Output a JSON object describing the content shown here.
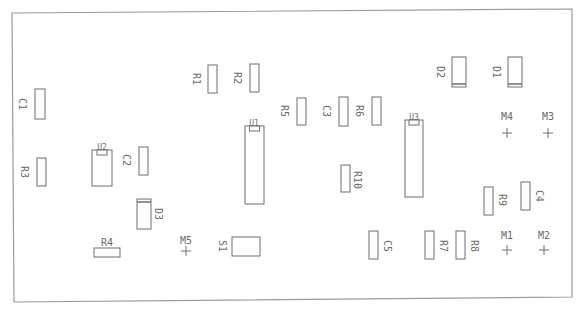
{
  "diagram": {
    "title": "",
    "type": "pcb-silkscreen-layout",
    "board_outline": {
      "points": [
        [
          12,
          13
        ],
        [
          572,
          9
        ],
        [
          572,
          297
        ],
        [
          14,
          302
        ]
      ]
    },
    "components": [
      {
        "ref": "C1",
        "type": "capacitor",
        "label": "C1",
        "x": 35,
        "y": 89,
        "w": 10,
        "h": 30,
        "label_rot": 90,
        "label_x": 22,
        "label_y": 104
      },
      {
        "ref": "R3",
        "type": "resistor",
        "label": "R3",
        "x": 37,
        "y": 158,
        "w": 9,
        "h": 28,
        "label_rot": 90,
        "label_x": 24,
        "label_y": 172
      },
      {
        "ref": "U2",
        "type": "ic",
        "label": "U2",
        "x": 92,
        "y": 150,
        "w": 20,
        "h": 36,
        "label_rot": 0,
        "label_x": 102,
        "label_y": 147
      },
      {
        "ref": "C2",
        "type": "capacitor",
        "label": "C2",
        "x": 139,
        "y": 147,
        "w": 9,
        "h": 28,
        "label_rot": 90,
        "label_x": 126,
        "label_y": 160
      },
      {
        "ref": "D3",
        "type": "diode",
        "label": "D3",
        "x": 137,
        "y": 199,
        "w": 14,
        "h": 30,
        "label_rot": 90,
        "label_x": 158,
        "label_y": 214
      },
      {
        "ref": "R4",
        "type": "resistor",
        "label": "R4",
        "x": 94,
        "y": 248,
        "w": 26,
        "h": 9,
        "label_rot": 0,
        "label_x": 107,
        "label_y": 243
      },
      {
        "ref": "R1",
        "type": "resistor",
        "label": "R1",
        "x": 208,
        "y": 65,
        "w": 9,
        "h": 28,
        "label_rot": 90,
        "label_x": 196,
        "label_y": 79
      },
      {
        "ref": "R2",
        "type": "resistor",
        "label": "R2",
        "x": 250,
        "y": 64,
        "w": 9,
        "h": 28,
        "label_rot": 90,
        "label_x": 237,
        "label_y": 78
      },
      {
        "ref": "U1",
        "type": "ic",
        "label": "U1",
        "x": 245,
        "y": 126,
        "w": 19,
        "h": 78,
        "label_rot": 0,
        "label_x": 254,
        "label_y": 123
      },
      {
        "ref": "R5",
        "type": "resistor",
        "label": "R5",
        "x": 297,
        "y": 98,
        "w": 9,
        "h": 27,
        "label_rot": 90,
        "label_x": 284,
        "label_y": 111
      },
      {
        "ref": "C3",
        "type": "capacitor",
        "label": "C3",
        "x": 339,
        "y": 97,
        "w": 9,
        "h": 29,
        "label_rot": 90,
        "label_x": 326,
        "label_y": 111
      },
      {
        "ref": "R6",
        "type": "resistor",
        "label": "R6",
        "x": 372,
        "y": 97,
        "w": 9,
        "h": 28,
        "label_rot": 90,
        "label_x": 359,
        "label_y": 111
      },
      {
        "ref": "R10",
        "type": "resistor",
        "label": "R10",
        "x": 341,
        "y": 165,
        "w": 9,
        "h": 27,
        "label_rot": 90,
        "label_x": 357,
        "label_y": 180
      },
      {
        "ref": "S1",
        "type": "switch",
        "label": "S1",
        "x": 232,
        "y": 237,
        "w": 28,
        "h": 19,
        "label_rot": 90,
        "label_x": 222,
        "label_y": 246
      },
      {
        "ref": "U3",
        "type": "ic",
        "label": "U3",
        "x": 405,
        "y": 120,
        "w": 18,
        "h": 77,
        "label_rot": 0,
        "label_x": 414,
        "label_y": 117
      },
      {
        "ref": "D2",
        "type": "diode",
        "label": "D2",
        "x": 452,
        "y": 57,
        "w": 14,
        "h": 30,
        "label_rot": 90,
        "label_x": 440,
        "label_y": 72
      },
      {
        "ref": "D1",
        "type": "diode",
        "label": "D1",
        "x": 508,
        "y": 57,
        "w": 14,
        "h": 30,
        "label_rot": 90,
        "label_x": 496,
        "label_y": 72
      },
      {
        "ref": "R9",
        "type": "resistor",
        "label": "R9",
        "x": 484,
        "y": 187,
        "w": 9,
        "h": 28,
        "label_rot": 90,
        "label_x": 502,
        "label_y": 200
      },
      {
        "ref": "C4",
        "type": "capacitor",
        "label": "C4",
        "x": 521,
        "y": 182,
        "w": 9,
        "h": 28,
        "label_rot": 90,
        "label_x": 539,
        "label_y": 196
      },
      {
        "ref": "C5",
        "type": "capacitor",
        "label": "C5",
        "x": 369,
        "y": 231,
        "w": 9,
        "h": 28,
        "label_rot": 90,
        "label_x": 387,
        "label_y": 246
      },
      {
        "ref": "R7",
        "type": "resistor",
        "label": "R7",
        "x": 425,
        "y": 231,
        "w": 9,
        "h": 28,
        "label_rot": 90,
        "label_x": 443,
        "label_y": 246
      },
      {
        "ref": "R8",
        "type": "resistor",
        "label": "R8",
        "x": 456,
        "y": 231,
        "w": 9,
        "h": 28,
        "label_rot": 90,
        "label_x": 474,
        "label_y": 246
      }
    ],
    "mounting_holes": [
      {
        "ref": "M4",
        "label": "M4",
        "x": 507,
        "y": 133,
        "label_x": 507,
        "label_y": 117
      },
      {
        "ref": "M3",
        "label": "M3",
        "x": 548,
        "y": 133,
        "label_x": 548,
        "label_y": 117
      },
      {
        "ref": "M1",
        "label": "M1",
        "x": 507,
        "y": 250,
        "label_x": 507,
        "label_y": 236
      },
      {
        "ref": "M2",
        "label": "M2",
        "x": 544,
        "y": 250,
        "label_x": 544,
        "label_y": 236
      },
      {
        "ref": "M5",
        "label": "M5",
        "x": 186,
        "y": 251,
        "label_x": 186,
        "label_y": 241
      }
    ],
    "colors": {
      "outline": "#9a9a9a",
      "part": "#6e6e6e",
      "text": "#6a6a6a",
      "background": "#ffffff"
    }
  }
}
